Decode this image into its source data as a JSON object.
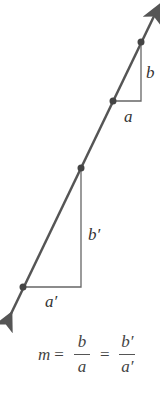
{
  "diagram": {
    "line_color": "#555555",
    "points": [
      {
        "x": 141,
        "y": 42
      },
      {
        "x": 113,
        "y": 101
      },
      {
        "x": 81,
        "y": 168
      },
      {
        "x": 23,
        "y": 287
      }
    ],
    "labels": {
      "small_rise": "b",
      "small_run": "a",
      "large_rise": "b′",
      "large_run": "a′"
    },
    "equation": {
      "lhs": "m",
      "eq1": "=",
      "frac1_num": "b",
      "frac1_den": "a",
      "eq2": "=",
      "frac2_num": "b′",
      "frac2_den": "a′"
    }
  }
}
